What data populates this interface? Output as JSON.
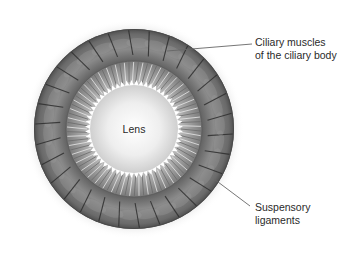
{
  "diagram": {
    "center": {
      "x": 134,
      "y": 129
    },
    "radii": {
      "glow": 110,
      "muscle_outer": 100,
      "muscle_inner": 68,
      "ligament_inner": 47,
      "lens": 44
    },
    "colors": {
      "muscle_dark": "#555555",
      "muscle_mid": "#7a7a7a",
      "muscle_light": "#9a9a9a",
      "ligament": "#8d8d8d",
      "lens_center": "#ffffff",
      "lens_edge": "#cfcfcf",
      "serration": "#ffffff",
      "leader_line": "#666666",
      "text": "#2a2a2a"
    },
    "muscle_segments": 30,
    "ligament_fibers": 90
  },
  "labels": {
    "lens": "Lens",
    "ciliary_line1": "Ciliary muscles",
    "ciliary_line2": "of the ciliary body",
    "suspensory_line1": "Suspensory",
    "suspensory_line2": "ligaments"
  },
  "leaders": {
    "ciliary": {
      "x1": 167,
      "y1": 51,
      "x2": 252,
      "y2": 44
    },
    "suspensory": {
      "x1": 214,
      "y1": 179,
      "x2": 250,
      "y2": 206
    }
  }
}
